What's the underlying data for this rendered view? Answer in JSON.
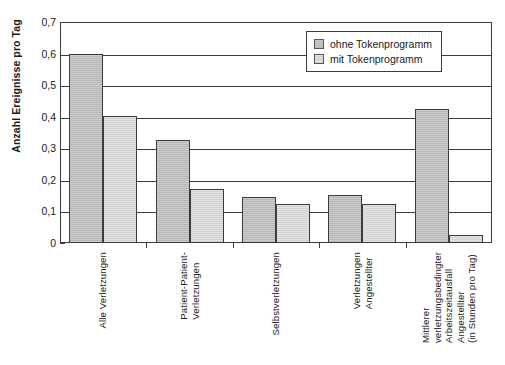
{
  "chart_data": {
    "type": "bar",
    "title": "",
    "subtitle": "",
    "xlabel": "",
    "ylabel": "Anzahl Ereignisse pro Tag",
    "ylim": [
      0,
      0.7
    ],
    "ytick_values": [
      0,
      0.1,
      0.2,
      0.3,
      0.4,
      0.5,
      0.6,
      0.7
    ],
    "ytick_labels": [
      "0",
      "0,1",
      "0,2",
      "0,3",
      "0,4",
      "0,5",
      "0,6",
      "0,7"
    ],
    "grid": true,
    "legend_position": "top-right",
    "decimal_separator": ",",
    "categories": [
      "Alle Verletzungen",
      "Patient-Patient-Verletzungen",
      "Selbstverletzungen",
      "Verletzungen Angestellter",
      "Mittlerer verletzungsbedingter Arbeitszeitausfall Angestellter (in Stunden pro Tag)"
    ],
    "category_label_lines": [
      [
        "Alle Verletzungen"
      ],
      [
        "Patient-Patient-",
        "Verletzungen"
      ],
      [
        "Selbstverletzungen"
      ],
      [
        "Verletzungen",
        "Angestellter"
      ],
      [
        "Mittlerer",
        "verletzungsbedingter",
        "Arbeitszeitausfall",
        "Angestellter",
        "(in Stunden pro Tag)"
      ]
    ],
    "series": [
      {
        "name": "ohne Tokenprogramm",
        "color": "#b6b6b6",
        "values": [
          0.6,
          0.325,
          0.145,
          0.153,
          0.425
        ]
      },
      {
        "name": "mit Tokenprogramm",
        "color": "#d2d2d2",
        "values": [
          0.402,
          0.172,
          0.124,
          0.124,
          0.025
        ]
      }
    ]
  },
  "legend": {
    "items": [
      {
        "label": "ohne Tokenprogramm"
      },
      {
        "label": "mit Tokenprogramm"
      }
    ]
  },
  "colors": {
    "series_a": "#b6b6b6",
    "series_b": "#d2d2d2",
    "axis": "#3c3c3c",
    "background": "#ffffff",
    "text": "#1a1a1a"
  }
}
